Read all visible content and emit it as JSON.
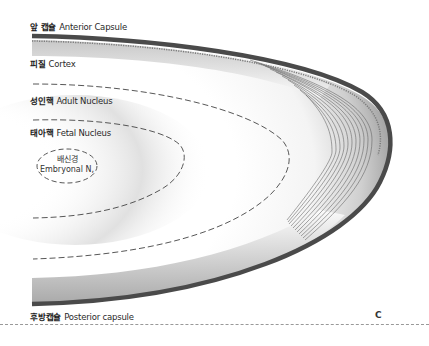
{
  "figure": {
    "panel_letter": "C"
  },
  "labels": {
    "anterior_capsule": {
      "ko": "앞 캡슐",
      "en": "Anterior Capsule"
    },
    "cortex": {
      "ko": "피질",
      "en": "Cortex"
    },
    "adult_nucleus": {
      "ko": "성인핵",
      "en": "Adult Nucleus"
    },
    "fetal_nucleus": {
      "ko": "태아핵",
      "en": "Fetal Nucleus"
    },
    "embryonal_nucleus": {
      "ko": "배신경",
      "en": "Embryonal N,"
    },
    "posterior_capsule": {
      "ko": "후방캡슐",
      "en": "Posterior capsule"
    }
  },
  "colors": {
    "capsule": "#4a4a4a",
    "fibers": "#6a6a6a",
    "shading": "#cfcfcf",
    "dash": "#444444",
    "separator": "#999999"
  }
}
